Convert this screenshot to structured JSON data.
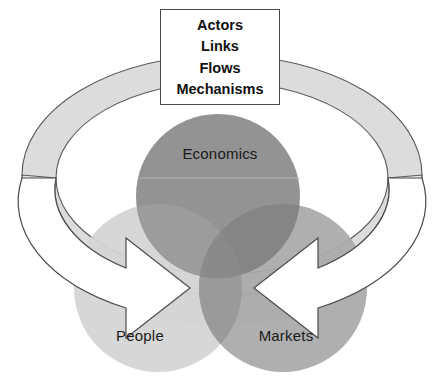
{
  "diagram": {
    "type": "venn-with-cycle-arrows",
    "callout": {
      "name": "callout-box",
      "lines": [
        "Actors",
        "Links",
        "Flows",
        "Mechanisms"
      ]
    },
    "circles": [
      {
        "id": "economics",
        "label": "Economics",
        "color": "#8e8e8e",
        "cx": 218,
        "cy": 196,
        "r": 82,
        "position": "top-center"
      },
      {
        "id": "people",
        "label": "People",
        "color": "#d2d2d2",
        "cx": 158,
        "cy": 288,
        "r": 84,
        "position": "bottom-left"
      },
      {
        "id": "markets",
        "label": "Markets",
        "color": "#a8a8a8",
        "cx": 283,
        "cy": 288,
        "r": 84,
        "position": "bottom-right"
      }
    ],
    "arrows": [
      {
        "id": "left-cycle-arrow",
        "direction": "clockwise-inward",
        "points_to": "People",
        "fill": "#ffffff",
        "stroke": "#4a4a4a"
      },
      {
        "id": "right-cycle-arrow",
        "direction": "counterclockwise-inward",
        "points_to": "Markets",
        "fill": "#ffffff",
        "stroke": "#4a4a4a"
      }
    ],
    "ribbon": {
      "id": "cycle-ribbon",
      "description": "3D elliptical band encircling the venn diagram",
      "fill": "#dcdcdc",
      "stroke": "#5a5a5a"
    },
    "colors": {
      "background": "#ffffff",
      "outline": "#4a4a4a",
      "text": "#1a1a1a",
      "ribbon_light": "#dcdcdc",
      "ribbon_shadow": "#c9c9c9"
    }
  }
}
